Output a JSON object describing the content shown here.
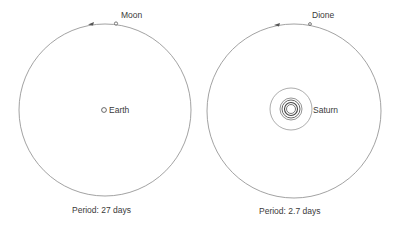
{
  "diagrams": [
    {
      "satellite": "Moon",
      "primary": "Earth",
      "period_label": "Period:  27 days"
    },
    {
      "satellite": "Dione",
      "primary": "Saturn",
      "period_label": "Period:  2.7 days"
    }
  ],
  "colors": {
    "line": "#7a7a7a",
    "text": "#3a3a3a",
    "background": "#ffffff"
  }
}
